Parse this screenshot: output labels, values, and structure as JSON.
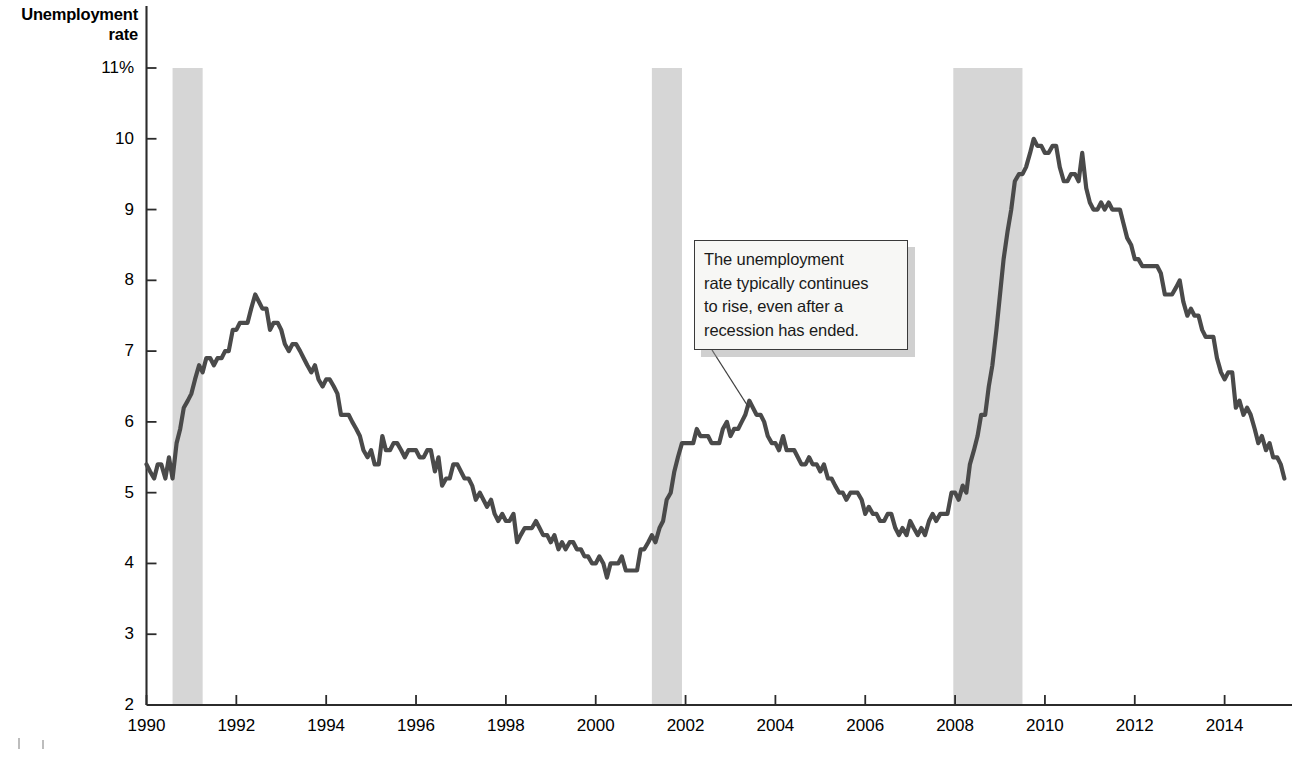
{
  "axes": {
    "y_title_line1": "Unemployment",
    "y_title_line2": "rate",
    "y_ticks": [
      "11%",
      "10",
      "9",
      "8",
      "7",
      "6",
      "5",
      "4",
      "3",
      "2"
    ],
    "x_ticks": [
      "1990",
      "1992",
      "1994",
      "1996",
      "1998",
      "2000",
      "2002",
      "2004",
      "2006",
      "2008",
      "2010",
      "2012",
      "2014"
    ]
  },
  "annotation": {
    "line1": "The unemployment",
    "line2": "rate typically continues",
    "line3": "to rise, even after a",
    "line4": "recession has ended."
  },
  "colors": {
    "line": "#4a4a4a",
    "recession_band": "#d6d6d6",
    "axis": "#2b2b2b",
    "callout_bg": "#f7f7f5",
    "callout_border": "#3a3a3a"
  },
  "chart_data": {
    "type": "line",
    "title": "",
    "xlabel": "",
    "ylabel": "Unemployment rate",
    "ylim": [
      2,
      11
    ],
    "xlim": [
      1990,
      2015.5
    ],
    "grid": false,
    "legend": "none",
    "y_unit": "percent",
    "y_tick_values": [
      11,
      10,
      9,
      8,
      7,
      6,
      5,
      4,
      3,
      2
    ],
    "x_tick_values": [
      1990,
      1992,
      1994,
      1996,
      1998,
      2000,
      2002,
      2004,
      2006,
      2008,
      2010,
      2012,
      2014
    ],
    "annotations": [
      {
        "text": "The unemployment rate typically continues to rise, even after a recession has ended.",
        "points_to_x": 2003.5,
        "points_to_y": 6.3
      }
    ],
    "shaded_regions": [
      {
        "label": "recession",
        "x_start": 1990.58,
        "x_end": 1991.25
      },
      {
        "label": "recession",
        "x_start": 2001.25,
        "x_end": 2001.92
      },
      {
        "label": "recession",
        "x_start": 2007.96,
        "x_end": 2009.5
      }
    ],
    "series": [
      {
        "name": "Unemployment rate",
        "color": "#4a4a4a",
        "x": [
          1990.0,
          1990.08,
          1990.17,
          1990.25,
          1990.33,
          1990.42,
          1990.5,
          1990.58,
          1990.67,
          1990.75,
          1990.83,
          1990.92,
          1991.0,
          1991.08,
          1991.17,
          1991.25,
          1991.33,
          1991.42,
          1991.5,
          1991.58,
          1991.67,
          1991.75,
          1991.83,
          1991.92,
          1992.0,
          1992.08,
          1992.17,
          1992.25,
          1992.33,
          1992.42,
          1992.5,
          1992.58,
          1992.67,
          1992.75,
          1992.83,
          1992.92,
          1993.0,
          1993.08,
          1993.17,
          1993.25,
          1993.33,
          1993.42,
          1993.5,
          1993.58,
          1993.67,
          1993.75,
          1993.83,
          1993.92,
          1994.0,
          1994.08,
          1994.17,
          1994.25,
          1994.33,
          1994.42,
          1994.5,
          1994.58,
          1994.67,
          1994.75,
          1994.83,
          1994.92,
          1995.0,
          1995.08,
          1995.17,
          1995.25,
          1995.33,
          1995.42,
          1995.5,
          1995.58,
          1995.67,
          1995.75,
          1995.83,
          1995.92,
          1996.0,
          1996.08,
          1996.17,
          1996.25,
          1996.33,
          1996.42,
          1996.5,
          1996.58,
          1996.67,
          1996.75,
          1996.83,
          1996.92,
          1997.0,
          1997.08,
          1997.17,
          1997.25,
          1997.33,
          1997.42,
          1997.5,
          1997.58,
          1997.67,
          1997.75,
          1997.83,
          1997.92,
          1998.0,
          1998.08,
          1998.17,
          1998.25,
          1998.33,
          1998.42,
          1998.5,
          1998.58,
          1998.67,
          1998.75,
          1998.83,
          1998.92,
          1999.0,
          1999.08,
          1999.17,
          1999.25,
          1999.33,
          1999.42,
          1999.5,
          1999.58,
          1999.67,
          1999.75,
          1999.83,
          1999.92,
          2000.0,
          2000.08,
          2000.17,
          2000.25,
          2000.33,
          2000.42,
          2000.5,
          2000.58,
          2000.67,
          2000.75,
          2000.83,
          2000.92,
          2001.0,
          2001.08,
          2001.17,
          2001.25,
          2001.33,
          2001.42,
          2001.5,
          2001.58,
          2001.67,
          2001.75,
          2001.83,
          2001.92,
          2002.0,
          2002.08,
          2002.17,
          2002.25,
          2002.33,
          2002.42,
          2002.5,
          2002.58,
          2002.67,
          2002.75,
          2002.83,
          2002.92,
          2003.0,
          2003.08,
          2003.17,
          2003.25,
          2003.33,
          2003.42,
          2003.5,
          2003.58,
          2003.67,
          2003.75,
          2003.83,
          2003.92,
          2004.0,
          2004.08,
          2004.17,
          2004.25,
          2004.33,
          2004.42,
          2004.5,
          2004.58,
          2004.67,
          2004.75,
          2004.83,
          2004.92,
          2005.0,
          2005.08,
          2005.17,
          2005.25,
          2005.33,
          2005.42,
          2005.5,
          2005.58,
          2005.67,
          2005.75,
          2005.83,
          2005.92,
          2006.0,
          2006.08,
          2006.17,
          2006.25,
          2006.33,
          2006.42,
          2006.5,
          2006.58,
          2006.67,
          2006.75,
          2006.83,
          2006.92,
          2007.0,
          2007.08,
          2007.17,
          2007.25,
          2007.33,
          2007.42,
          2007.5,
          2007.58,
          2007.67,
          2007.75,
          2007.83,
          2007.92,
          2008.0,
          2008.08,
          2008.17,
          2008.25,
          2008.33,
          2008.42,
          2008.5,
          2008.58,
          2008.67,
          2008.75,
          2008.83,
          2008.92,
          2009.0,
          2009.08,
          2009.17,
          2009.25,
          2009.33,
          2009.42,
          2009.5,
          2009.58,
          2009.67,
          2009.75,
          2009.83,
          2009.92,
          2010.0,
          2010.08,
          2010.17,
          2010.25,
          2010.33,
          2010.42,
          2010.5,
          2010.58,
          2010.67,
          2010.75,
          2010.83,
          2010.92,
          2011.0,
          2011.08,
          2011.17,
          2011.25,
          2011.33,
          2011.42,
          2011.5,
          2011.58,
          2011.67,
          2011.75,
          2011.83,
          2011.92,
          2012.0,
          2012.08,
          2012.17,
          2012.25,
          2012.33,
          2012.42,
          2012.5,
          2012.58,
          2012.67,
          2012.75,
          2012.83,
          2012.92,
          2013.0,
          2013.08,
          2013.17,
          2013.25,
          2013.33,
          2013.42,
          2013.5,
          2013.58,
          2013.67,
          2013.75,
          2013.83,
          2013.92,
          2014.0,
          2014.08,
          2014.17,
          2014.25,
          2014.33,
          2014.42,
          2014.5,
          2014.58,
          2014.67,
          2014.75,
          2014.83,
          2014.92,
          2015.0,
          2015.08,
          2015.17,
          2015.25,
          2015.33
        ],
        "y": [
          5.4,
          5.3,
          5.2,
          5.4,
          5.4,
          5.2,
          5.5,
          5.2,
          5.7,
          5.9,
          6.2,
          6.3,
          6.4,
          6.6,
          6.8,
          6.7,
          6.9,
          6.9,
          6.8,
          6.9,
          6.9,
          7.0,
          7.0,
          7.3,
          7.3,
          7.4,
          7.4,
          7.4,
          7.6,
          7.8,
          7.7,
          7.6,
          7.6,
          7.3,
          7.4,
          7.4,
          7.3,
          7.1,
          7.0,
          7.1,
          7.1,
          7.0,
          6.9,
          6.8,
          6.7,
          6.8,
          6.6,
          6.5,
          6.6,
          6.6,
          6.5,
          6.4,
          6.1,
          6.1,
          6.1,
          6.0,
          5.9,
          5.8,
          5.6,
          5.5,
          5.6,
          5.4,
          5.4,
          5.8,
          5.6,
          5.6,
          5.7,
          5.7,
          5.6,
          5.5,
          5.6,
          5.6,
          5.6,
          5.5,
          5.5,
          5.6,
          5.6,
          5.3,
          5.5,
          5.1,
          5.2,
          5.2,
          5.4,
          5.4,
          5.3,
          5.2,
          5.2,
          5.1,
          4.9,
          5.0,
          4.9,
          4.8,
          4.9,
          4.7,
          4.6,
          4.7,
          4.6,
          4.6,
          4.7,
          4.3,
          4.4,
          4.5,
          4.5,
          4.5,
          4.6,
          4.5,
          4.4,
          4.4,
          4.3,
          4.4,
          4.2,
          4.3,
          4.2,
          4.3,
          4.3,
          4.2,
          4.2,
          4.1,
          4.1,
          4.0,
          4.0,
          4.1,
          4.0,
          3.8,
          4.0,
          4.0,
          4.0,
          4.1,
          3.9,
          3.9,
          3.9,
          3.9,
          4.2,
          4.2,
          4.3,
          4.4,
          4.3,
          4.5,
          4.6,
          4.9,
          5.0,
          5.3,
          5.5,
          5.7,
          5.7,
          5.7,
          5.7,
          5.9,
          5.8,
          5.8,
          5.8,
          5.7,
          5.7,
          5.7,
          5.9,
          6.0,
          5.8,
          5.9,
          5.9,
          6.0,
          6.1,
          6.3,
          6.2,
          6.1,
          6.1,
          6.0,
          5.8,
          5.7,
          5.7,
          5.6,
          5.8,
          5.6,
          5.6,
          5.6,
          5.5,
          5.4,
          5.4,
          5.5,
          5.4,
          5.4,
          5.3,
          5.4,
          5.2,
          5.2,
          5.1,
          5.0,
          5.0,
          4.9,
          5.0,
          5.0,
          5.0,
          4.9,
          4.7,
          4.8,
          4.7,
          4.7,
          4.6,
          4.6,
          4.7,
          4.7,
          4.5,
          4.4,
          4.5,
          4.4,
          4.6,
          4.5,
          4.4,
          4.5,
          4.4,
          4.6,
          4.7,
          4.6,
          4.7,
          4.7,
          4.7,
          5.0,
          5.0,
          4.9,
          5.1,
          5.0,
          5.4,
          5.6,
          5.8,
          6.1,
          6.1,
          6.5,
          6.8,
          7.3,
          7.8,
          8.3,
          8.7,
          9.0,
          9.4,
          9.5,
          9.5,
          9.6,
          9.8,
          10.0,
          9.9,
          9.9,
          9.8,
          9.8,
          9.9,
          9.9,
          9.6,
          9.4,
          9.4,
          9.5,
          9.5,
          9.4,
          9.8,
          9.3,
          9.1,
          9.0,
          9.0,
          9.1,
          9.0,
          9.1,
          9.0,
          9.0,
          9.0,
          8.8,
          8.6,
          8.5,
          8.3,
          8.3,
          8.2,
          8.2,
          8.2,
          8.2,
          8.2,
          8.1,
          7.8,
          7.8,
          7.8,
          7.9,
          8.0,
          7.7,
          7.5,
          7.6,
          7.5,
          7.5,
          7.3,
          7.2,
          7.2,
          7.2,
          6.9,
          6.7,
          6.6,
          6.7,
          6.7,
          6.2,
          6.3,
          6.1,
          6.2,
          6.1,
          5.9,
          5.7,
          5.8,
          5.6,
          5.7,
          5.5,
          5.5,
          5.4,
          5.2
        ]
      }
    ]
  }
}
